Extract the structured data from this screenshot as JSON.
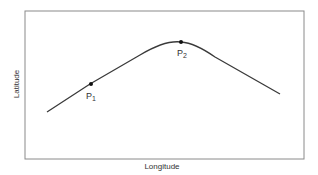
{
  "diagram": {
    "x_axis_label": "Longitude",
    "y_axis_label": "Latitude",
    "points": [
      {
        "name": "P",
        "sub": "1"
      },
      {
        "name": "P",
        "sub": "2"
      }
    ],
    "colors": {
      "frame": "#8a8a8a",
      "curve": "#3a3a3a",
      "point": "#111111",
      "text": "#333333"
    }
  }
}
